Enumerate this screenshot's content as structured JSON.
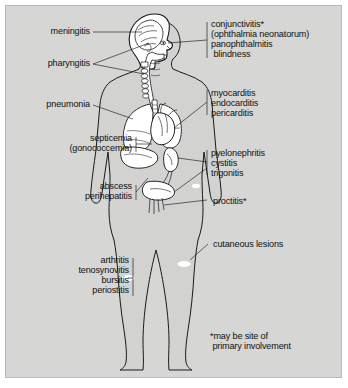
{
  "figure": {
    "background_color": "#d6d6d4",
    "ink_color": "#1a1a1a",
    "organ_fill": "#ffffff",
    "lesion_marker_color": "#ffffff"
  },
  "footnote": {
    "line1": "*may be site of",
    "line2": " primary involvement"
  },
  "labels_left": [
    {
      "id": "meningitis",
      "text": "meningitis"
    },
    {
      "id": "pharyngitis",
      "text": "pharyngitis"
    },
    {
      "id": "pneumonia",
      "text": "pneumonia"
    },
    {
      "id": "septicemia",
      "text": "septicemia"
    },
    {
      "id": "gonococcemia",
      "text": "(gonococcemia)"
    },
    {
      "id": "abscess",
      "text": "abscess"
    },
    {
      "id": "perihepatitis",
      "text": "perihepatitis"
    },
    {
      "id": "arthritis",
      "text": "arthritis"
    },
    {
      "id": "tenosynovitis",
      "text": "tenosynovitis"
    },
    {
      "id": "bursitis",
      "text": "bursitis"
    },
    {
      "id": "periostitis",
      "text": "periostitis"
    }
  ],
  "labels_right": [
    {
      "id": "conjunctivitis",
      "text": "conjunctivitis*"
    },
    {
      "id": "ophthalmia-neonatorum",
      "text": "(ophthalmia neonatorum)"
    },
    {
      "id": "panophthalmitis",
      "text": "panophthalmitis"
    },
    {
      "id": "blindness",
      "text": " blindness"
    },
    {
      "id": "myocarditis",
      "text": "myocarditis"
    },
    {
      "id": "endocarditis",
      "text": "endocarditis"
    },
    {
      "id": "pericarditis",
      "text": "pericarditis"
    },
    {
      "id": "pyelonephritis",
      "text": "pyelonephritis"
    },
    {
      "id": "cystitis",
      "text": "cystitis"
    },
    {
      "id": "trigonitis",
      "text": "trigonitis"
    },
    {
      "id": "proctitis",
      "text": "proctitis*"
    },
    {
      "id": "cutaneous-lesions",
      "text": "cutaneous lesions"
    }
  ],
  "anatomy_parts": [
    "body-outline",
    "head-profile",
    "brain",
    "nasopharynx",
    "spine",
    "trachea",
    "lungs",
    "heart",
    "liver",
    "kidney",
    "ureter",
    "bladder",
    "rectum",
    "skin-lesions"
  ]
}
